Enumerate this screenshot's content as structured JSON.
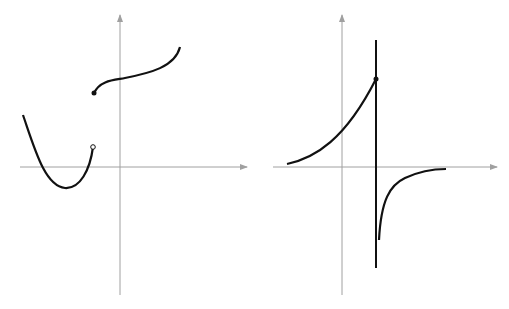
{
  "diagram": {
    "panels": [
      {
        "id": "left",
        "description": "Piecewise function with jump discontinuity",
        "axes": {
          "color": "#a0a0a0",
          "x_axis": {
            "x1": 20,
            "y": 167,
            "x2": 247
          },
          "y_axis": {
            "x": 120,
            "y1": 295,
            "y2": 15
          }
        },
        "curves": [
          {
            "name": "parabola-branch",
            "path": "M23,115 C35,150 45,186 65,188 C80,189 90,170 93,147"
          },
          {
            "name": "upper-branch",
            "path": "M94,93 C100,80 115,80 125,78 C150,73 175,67 180,47"
          }
        ],
        "points": [
          {
            "name": "open-endpoint",
            "cx": 93,
            "cy": 147,
            "filled": false
          },
          {
            "name": "closed-endpoint",
            "cx": 94,
            "cy": 93,
            "filled": true
          }
        ],
        "curve_color": "#111111"
      },
      {
        "id": "right",
        "description": "Function with vertical asymptote",
        "axes": {
          "color": "#a0a0a0",
          "x_axis": {
            "x1": 273,
            "y": 167,
            "x2": 497
          },
          "y_axis": {
            "x": 342,
            "y1": 295,
            "y2": 15
          }
        },
        "asymptote": {
          "x": 376,
          "y1": 40,
          "y2": 268
        },
        "curves": [
          {
            "name": "left-branch",
            "path": "M287,164 C315,158 345,140 376,79"
          },
          {
            "name": "right-branch",
            "path": "M379,240 C381,200 390,185 405,178 C420,171 435,169 446,169"
          }
        ],
        "points": [
          {
            "name": "closed-endpoint",
            "cx": 376,
            "cy": 79,
            "filled": true
          }
        ],
        "curve_color": "#111111"
      }
    ]
  }
}
